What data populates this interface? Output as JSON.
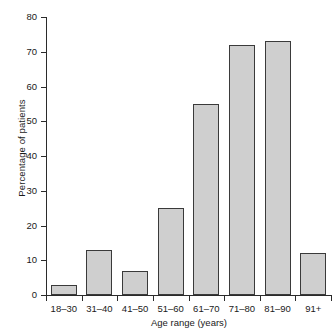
{
  "chart_data": {
    "type": "bar",
    "title": "",
    "subtitle": "",
    "xlabel": "Age range (years)",
    "ylabel": "Percentage of patients",
    "categories": [
      "18–30",
      "31–40",
      "41–50",
      "51–60",
      "61–70",
      "71–80",
      "81–90",
      "91+"
    ],
    "values": [
      3,
      13,
      7,
      25,
      55,
      72,
      73,
      12
    ],
    "ylim": [
      0,
      80
    ],
    "yticks": [
      0,
      10,
      20,
      30,
      40,
      50,
      60,
      70,
      80
    ],
    "ytick_labels": [
      "0",
      "10",
      "20",
      "30",
      "40",
      "50",
      "60",
      "70",
      "80"
    ],
    "grid": false,
    "legend": null,
    "legend_position": "none",
    "annotations": [],
    "bar_fill_color": "#cfcfcf",
    "bar_edge_color": "#3a3a3a",
    "axis_color": "#2b2b2b",
    "background_color": "#ffffff"
  }
}
